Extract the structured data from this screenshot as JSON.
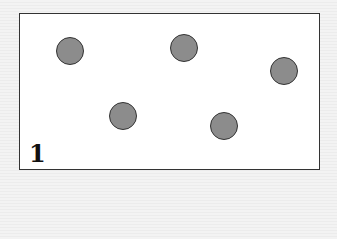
{
  "panel": {
    "label": "1",
    "dots": [
      {
        "x": 70,
        "y": 51
      },
      {
        "x": 184,
        "y": 48
      },
      {
        "x": 284,
        "y": 71
      },
      {
        "x": 123,
        "y": 116
      },
      {
        "x": 224,
        "y": 126
      }
    ],
    "dot_count": 5,
    "colors": {
      "dot_fill": "#8c8c8c",
      "dot_stroke": "#333333",
      "frame": "#333333"
    }
  }
}
